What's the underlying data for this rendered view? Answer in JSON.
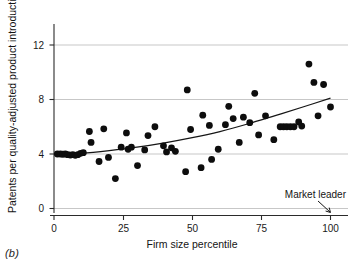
{
  "figure": {
    "panel_label": "(b)"
  },
  "chart_data": {
    "type": "scatter",
    "title": "",
    "subtitle": "",
    "xlabel": "Firm size percentile",
    "ylabel": "Patents per quality-adjusted product introduction",
    "xlim": [
      0,
      103
    ],
    "ylim": [
      0,
      13
    ],
    "xticks": [
      0,
      25,
      50,
      75,
      100
    ],
    "xtick_labels": [
      "0",
      "25",
      "50",
      "75",
      "100"
    ],
    "yticks": [
      0,
      4,
      8,
      12
    ],
    "ytick_labels": [
      "0",
      "4",
      "8",
      "12"
    ],
    "grid": "horizontal",
    "legend": "none",
    "marker_color": "#0d0d0d",
    "curve_color": "#161616",
    "annotations": [
      {
        "text": "Market leader",
        "x": 100,
        "y": 1.55,
        "arrow_to_x": 100,
        "arrow_to_y": 0.1
      }
    ],
    "points": [
      {
        "x": 1.2,
        "y": 4.0
      },
      {
        "x": 2.3,
        "y": 4.0
      },
      {
        "x": 3.2,
        "y": 3.98
      },
      {
        "x": 4.1,
        "y": 4.0
      },
      {
        "x": 5.0,
        "y": 3.95
      },
      {
        "x": 5.9,
        "y": 3.92
      },
      {
        "x": 6.8,
        "y": 3.95
      },
      {
        "x": 7.7,
        "y": 3.9
      },
      {
        "x": 8.6,
        "y": 3.95
      },
      {
        "x": 9.6,
        "y": 4.05
      },
      {
        "x": 10.6,
        "y": 4.1
      },
      {
        "x": 12.8,
        "y": 5.65
      },
      {
        "x": 13.4,
        "y": 4.85
      },
      {
        "x": 16.3,
        "y": 3.45
      },
      {
        "x": 18.0,
        "y": 5.85
      },
      {
        "x": 19.7,
        "y": 3.75
      },
      {
        "x": 22.2,
        "y": 2.2
      },
      {
        "x": 24.3,
        "y": 4.5
      },
      {
        "x": 26.2,
        "y": 5.55
      },
      {
        "x": 26.8,
        "y": 4.35
      },
      {
        "x": 28.0,
        "y": 4.5
      },
      {
        "x": 30.2,
        "y": 3.15
      },
      {
        "x": 32.8,
        "y": 4.3
      },
      {
        "x": 34.0,
        "y": 5.35
      },
      {
        "x": 36.5,
        "y": 6.0
      },
      {
        "x": 39.6,
        "y": 4.6
      },
      {
        "x": 40.7,
        "y": 4.15
      },
      {
        "x": 42.5,
        "y": 4.45
      },
      {
        "x": 43.9,
        "y": 4.2
      },
      {
        "x": 47.6,
        "y": 2.7
      },
      {
        "x": 48.2,
        "y": 8.7
      },
      {
        "x": 49.4,
        "y": 5.8
      },
      {
        "x": 53.2,
        "y": 3.0
      },
      {
        "x": 53.8,
        "y": 6.85
      },
      {
        "x": 56.2,
        "y": 6.1
      },
      {
        "x": 57.0,
        "y": 3.6
      },
      {
        "x": 59.4,
        "y": 4.35
      },
      {
        "x": 62.0,
        "y": 6.15
      },
      {
        "x": 63.2,
        "y": 7.5
      },
      {
        "x": 64.8,
        "y": 6.6
      },
      {
        "x": 67.0,
        "y": 4.85
      },
      {
        "x": 68.5,
        "y": 6.7
      },
      {
        "x": 70.8,
        "y": 6.3
      },
      {
        "x": 72.6,
        "y": 8.45
      },
      {
        "x": 74.0,
        "y": 5.4
      },
      {
        "x": 76.5,
        "y": 6.8
      },
      {
        "x": 79.5,
        "y": 5.05
      },
      {
        "x": 81.8,
        "y": 6.0
      },
      {
        "x": 83.0,
        "y": 6.0
      },
      {
        "x": 84.2,
        "y": 6.0
      },
      {
        "x": 85.5,
        "y": 6.0
      },
      {
        "x": 86.8,
        "y": 6.0
      },
      {
        "x": 88.5,
        "y": 6.35
      },
      {
        "x": 89.6,
        "y": 6.05
      },
      {
        "x": 92.2,
        "y": 10.6
      },
      {
        "x": 94.0,
        "y": 9.25
      },
      {
        "x": 95.5,
        "y": 6.8
      },
      {
        "x": 97.5,
        "y": 9.1
      },
      {
        "x": 100.0,
        "y": 7.45
      }
    ],
    "fit_curve": {
      "label": "fitted trend",
      "x": [
        1,
        10,
        20,
        30,
        40,
        50,
        60,
        70,
        80,
        90,
        100
      ],
      "y": [
        3.97,
        4.05,
        4.25,
        4.5,
        4.82,
        5.2,
        5.65,
        6.2,
        6.82,
        7.45,
        8.1
      ]
    }
  }
}
